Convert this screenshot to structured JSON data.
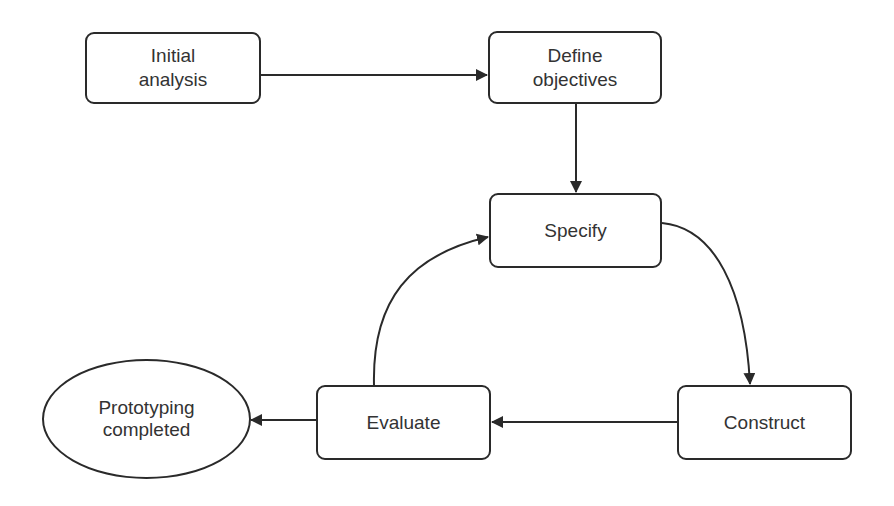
{
  "diagram": {
    "type": "flowchart",
    "colors": {
      "stroke": "#2a2a2a",
      "text": "#333333",
      "background": "#ffffff"
    },
    "nodes": [
      {
        "id": "initial-analysis",
        "shape": "rounded-rect",
        "label": "Initial\nanalysis"
      },
      {
        "id": "define-objectives",
        "shape": "rounded-rect",
        "label": "Define\nobjectives"
      },
      {
        "id": "specify",
        "shape": "rounded-rect",
        "label": "Specify"
      },
      {
        "id": "construct",
        "shape": "rounded-rect",
        "label": "Construct"
      },
      {
        "id": "evaluate",
        "shape": "rounded-rect",
        "label": "Evaluate"
      },
      {
        "id": "prototyping-completed",
        "shape": "ellipse",
        "label": "Prototyping\ncompleted"
      }
    ],
    "edges": [
      {
        "from": "initial-analysis",
        "to": "define-objectives",
        "style": "straight"
      },
      {
        "from": "define-objectives",
        "to": "specify",
        "style": "straight"
      },
      {
        "from": "specify",
        "to": "construct",
        "style": "curved"
      },
      {
        "from": "construct",
        "to": "evaluate",
        "style": "straight"
      },
      {
        "from": "evaluate",
        "to": "specify",
        "style": "curved"
      },
      {
        "from": "evaluate",
        "to": "prototyping-completed",
        "style": "straight"
      }
    ]
  }
}
